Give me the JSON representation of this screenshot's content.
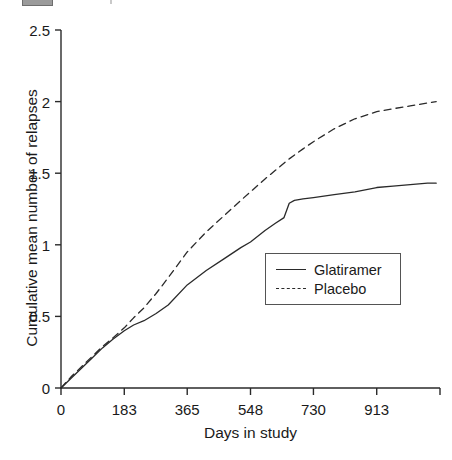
{
  "figure": {
    "artifact_label": "",
    "background_color": "#ffffff",
    "line_color": "#2a2a2a",
    "axis_color": "#2a2a2a"
  },
  "chart_data": {
    "type": "line",
    "title": "",
    "xlabel": "Days in study",
    "ylabel": "Cumulative mean number of relapses",
    "xlim": [
      0,
      1096
    ],
    "ylim": [
      0,
      2.5
    ],
    "grid": false,
    "legend_position": "center-right",
    "xticks": [
      0,
      183,
      365,
      548,
      730,
      913,
      1096
    ],
    "xtick_labels": [
      "0",
      "183",
      "365",
      "548",
      "730",
      "913",
      ""
    ],
    "yticks": [
      0,
      0.5,
      1,
      1.5,
      2,
      2.5
    ],
    "ytick_labels": [
      "0",
      "0.5",
      "1",
      "1.5",
      "2",
      "2.5"
    ],
    "series": [
      {
        "name": "Glatiramer",
        "style": "solid",
        "color": "#2a2a2a",
        "x": [
          0,
          30,
          60,
          90,
          120,
          150,
          183,
          210,
          240,
          275,
          310,
          365,
          420,
          470,
          520,
          548,
          590,
          620,
          645,
          660,
          675,
          700,
          730,
          790,
          850,
          913,
          960,
          1010,
          1060,
          1085
        ],
        "y": [
          0.0,
          0.07,
          0.14,
          0.21,
          0.28,
          0.34,
          0.4,
          0.44,
          0.47,
          0.52,
          0.58,
          0.72,
          0.82,
          0.9,
          0.98,
          1.02,
          1.1,
          1.15,
          1.19,
          1.29,
          1.31,
          1.32,
          1.33,
          1.35,
          1.37,
          1.4,
          1.41,
          1.42,
          1.43,
          1.43
        ]
      },
      {
        "name": "Placebo",
        "style": "dashed",
        "color": "#2a2a2a",
        "x": [
          0,
          30,
          60,
          90,
          120,
          150,
          183,
          210,
          240,
          275,
          310,
          365,
          420,
          470,
          520,
          548,
          590,
          620,
          660,
          700,
          730,
          790,
          850,
          913,
          960,
          1010,
          1060,
          1085
        ],
        "y": [
          0.0,
          0.08,
          0.15,
          0.22,
          0.29,
          0.35,
          0.42,
          0.49,
          0.56,
          0.66,
          0.77,
          0.95,
          1.09,
          1.2,
          1.31,
          1.37,
          1.46,
          1.52,
          1.6,
          1.67,
          1.72,
          1.81,
          1.88,
          1.93,
          1.95,
          1.97,
          1.99,
          2.0
        ]
      }
    ]
  }
}
